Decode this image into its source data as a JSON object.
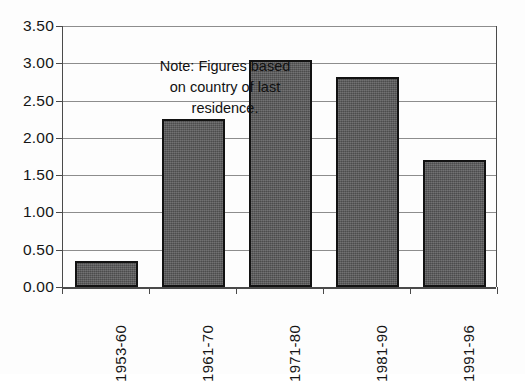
{
  "chart_data": {
    "type": "bar",
    "title": "",
    "subtitle": "",
    "xlabel": "",
    "ylabel": "",
    "categories": [
      "1953-60",
      "1961-70",
      "1971-80",
      "1981-90",
      "1991-96"
    ],
    "values": [
      0.35,
      2.25,
      3.05,
      2.82,
      1.7
    ],
    "series": [
      {
        "name": "Immigrants (millions)",
        "values": [
          0.35,
          2.25,
          3.05,
          2.82,
          1.7
        ]
      }
    ],
    "ylim": [
      0.0,
      3.5
    ],
    "ytick_step": 0.5,
    "ytick_labels": [
      "0.00",
      "0.50",
      "1.00",
      "1.50",
      "2.00",
      "2.50",
      "3.00",
      "3.50"
    ],
    "ytick_values": [
      0.0,
      0.5,
      1.0,
      1.5,
      2.0,
      2.5,
      3.0,
      3.5
    ],
    "grid": true,
    "legend": false,
    "legend_position": "none",
    "annotations": [
      {
        "name": "note",
        "lines": [
          "Note: Figures based",
          "on country of last",
          "residence."
        ],
        "text": "Note: Figures based on country of last residence.",
        "position": "top-left-inside-plot"
      }
    ],
    "colors": {
      "bar_fill": "#59595a",
      "bar_border": "#121212",
      "gridline": "#8d8d8d",
      "axis": "#4a4a4a",
      "text": "#151515",
      "background": "#fdfdfd"
    }
  }
}
